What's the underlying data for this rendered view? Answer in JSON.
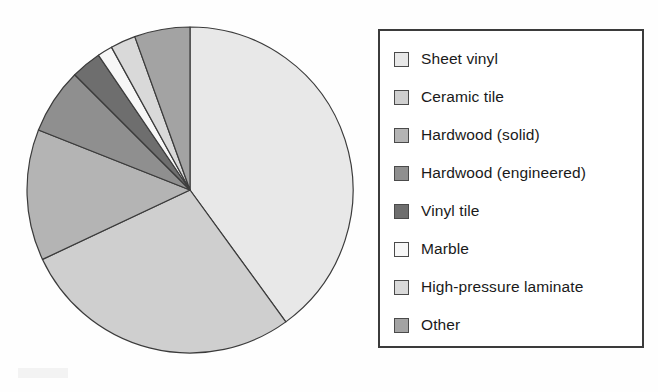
{
  "chart_data": {
    "type": "pie",
    "title": "",
    "subtitle": "",
    "xlabel": "",
    "ylabel": "",
    "grid": false,
    "legend_position": "right",
    "start_angle_deg": 0,
    "direction": "clockwise",
    "center": {
      "x": 190,
      "y": 190
    },
    "radius": 163,
    "categories": [
      "Sheet vinyl",
      "Ceramic tile",
      "Hardwood (solid)",
      "Hardwood (engineered)",
      "Vinyl tile",
      "Marble",
      "High-pressure laminate",
      "Other"
    ],
    "values": [
      40,
      28,
      13,
      6.5,
      3,
      1.5,
      2.5,
      5.5
    ],
    "colors": [
      "#e8e8e8",
      "#cfcfcf",
      "#b4b4b4",
      "#8f8f8f",
      "#6e6e6e",
      "#f7f7f7",
      "#d9d9d9",
      "#a3a3a3"
    ],
    "slice_border_color": "#3b3b3b",
    "slice_border_width": 1.2
  },
  "legend": {
    "border_color": "#3b3b3b",
    "background": "#ffffff",
    "items": [
      {
        "label": "Sheet vinyl",
        "color": "#e8e8e8"
      },
      {
        "label": "Ceramic tile",
        "color": "#cfcfcf"
      },
      {
        "label": "Hardwood (solid)",
        "color": "#b4b4b4"
      },
      {
        "label": "Hardwood (engineered)",
        "color": "#8f8f8f"
      },
      {
        "label": "Vinyl tile",
        "color": "#6e6e6e"
      },
      {
        "label": "Marble",
        "color": "#f7f7f7"
      },
      {
        "label": "High-pressure laminate",
        "color": "#d9d9d9"
      },
      {
        "label": "Other",
        "color": "#a3a3a3"
      }
    ]
  }
}
